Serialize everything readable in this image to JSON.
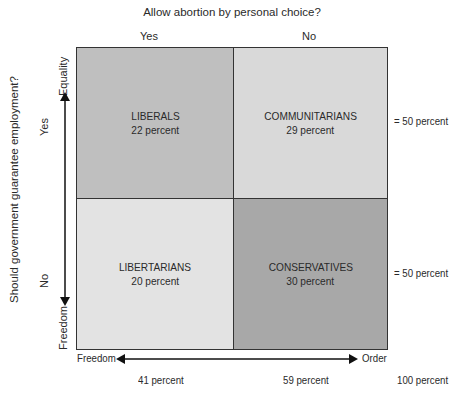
{
  "title": "Allow abortion by personal choice?",
  "columns": {
    "yes": "Yes",
    "no": "No"
  },
  "y_axis": {
    "question": "Should government guarantee employment?",
    "yes": "Yes",
    "no": "No",
    "top_end": "Equality",
    "bottom_end": "Freedom"
  },
  "x_axis": {
    "left_end": "Freedom",
    "right_end": "Order"
  },
  "quadrants": [
    {
      "name": "LIBERALS",
      "percent": "22 percent",
      "color": "#bfbfbf"
    },
    {
      "name": "COMMUNITARIANS",
      "percent": "29 percent",
      "color": "#d9d9d9"
    },
    {
      "name": "LIBERTARIANS",
      "percent": "20 percent",
      "color": "#e3e3e3"
    },
    {
      "name": "CONSERVATIVES",
      "percent": "30 percent",
      "color": "#a8a8a8"
    }
  ],
  "row_totals": [
    "= 50 percent",
    "= 50 percent"
  ],
  "column_totals": [
    "41 percent",
    "59 percent"
  ],
  "grand_total": "100 percent"
}
